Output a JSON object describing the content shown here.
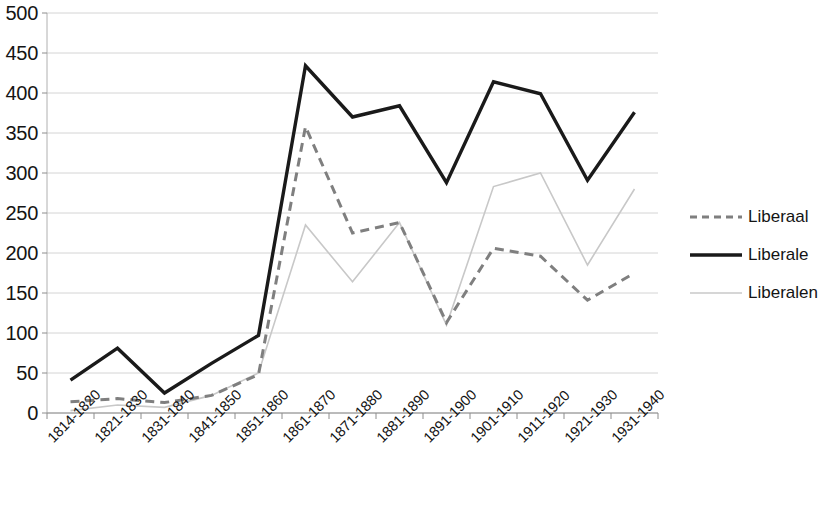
{
  "chart_data": {
    "type": "line",
    "title": "",
    "subtitle": "",
    "xlabel": "",
    "ylabel": "",
    "ylim": [
      0,
      500
    ],
    "ytick_step": 50,
    "grid": true,
    "legend_position": "right",
    "categories": [
      "1814-1820",
      "1821-1830",
      "1831-1840",
      "1841-1850",
      "1851-1860",
      "1861-1870",
      "1871-1880",
      "1881-1890",
      "1891-1900",
      "1901-1910",
      "1911-1920",
      "1921-1930",
      "1931-1940"
    ],
    "ytick_labels": [
      "0",
      "50",
      "100",
      "150",
      "200",
      "250",
      "300",
      "350",
      "400",
      "450",
      "500"
    ],
    "ytick_values": [
      0,
      50,
      100,
      150,
      200,
      250,
      300,
      350,
      400,
      450,
      500
    ],
    "series": [
      {
        "name": "Liberaal",
        "style": "dashed",
        "color": "#7f7f7f",
        "width": 3,
        "values": [
          14,
          18,
          13,
          22,
          48,
          358,
          225,
          238,
          113,
          206,
          196,
          141,
          175
        ]
      },
      {
        "name": "Liberale",
        "style": "solid",
        "color": "#1a1a1a",
        "width": 3.4,
        "values": [
          41,
          81,
          25,
          62,
          97,
          434,
          370,
          384,
          288,
          414,
          399,
          291,
          376
        ]
      },
      {
        "name": "Liberalen",
        "style": "thin",
        "color": "#c8c8c8",
        "width": 1.6,
        "values": [
          3,
          10,
          7,
          22,
          50,
          235,
          164,
          238,
          110,
          283,
          300,
          185,
          280
        ]
      }
    ]
  },
  "legend": {
    "items": [
      {
        "label": "Liberaal"
      },
      {
        "label": "Liberale"
      },
      {
        "label": "Liberalen"
      }
    ]
  }
}
